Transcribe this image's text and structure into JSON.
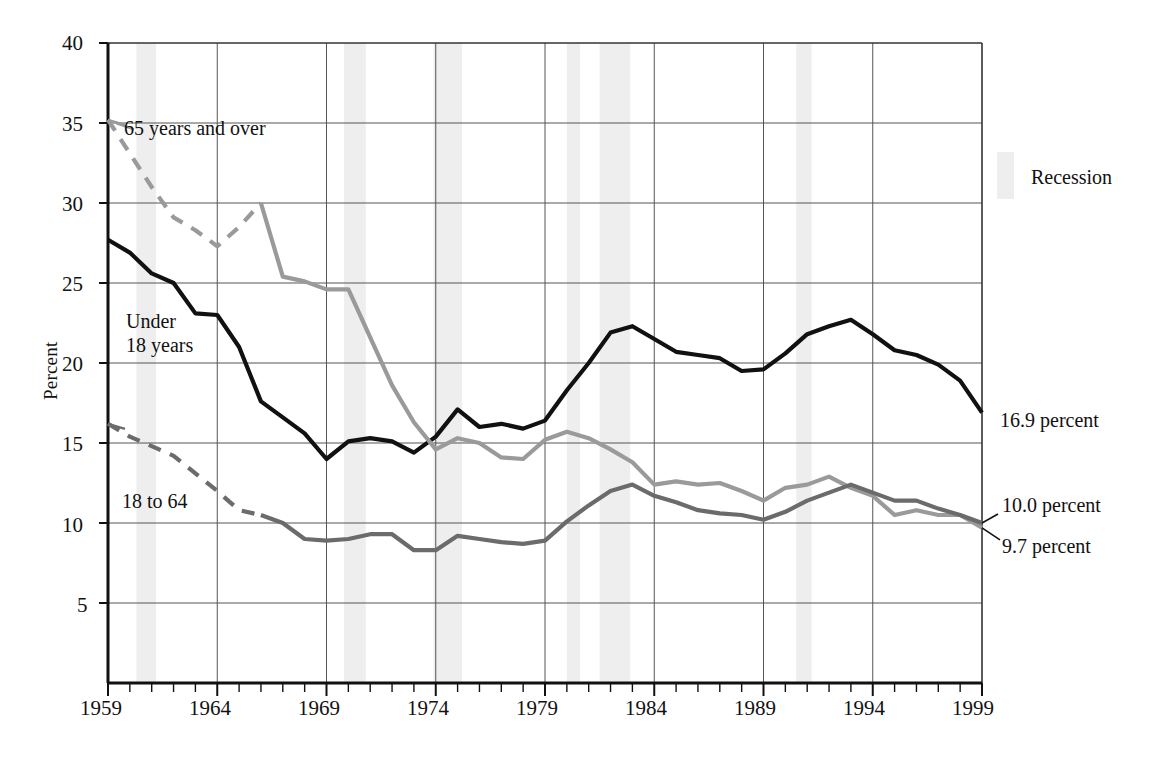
{
  "chart_data": {
    "type": "line",
    "title": "",
    "xlabel": "",
    "ylabel": "Percent",
    "xlim": [
      1959,
      1999
    ],
    "ylim": [
      0,
      40
    ],
    "ytick_values": [
      5,
      10,
      15,
      20,
      25,
      30,
      35,
      40
    ],
    "ytick_labels": [
      "5",
      "10",
      "15",
      "20",
      "25",
      "30",
      "35",
      "40"
    ],
    "xtick_labels": [
      "1959",
      "1964",
      "1969",
      "1974",
      "1979",
      "1984",
      "1989",
      "1994",
      "1999"
    ],
    "xtick_values": [
      1959,
      1964,
      1969,
      1974,
      1979,
      1984,
      1989,
      1994,
      1999
    ],
    "grid": "both",
    "minor_xticks_every": 1,
    "x": [
      1959,
      1960,
      1961,
      1962,
      1963,
      1964,
      1965,
      1966,
      1967,
      1968,
      1969,
      1970,
      1971,
      1972,
      1973,
      1974,
      1975,
      1976,
      1977,
      1978,
      1979,
      1980,
      1981,
      1982,
      1983,
      1984,
      1985,
      1986,
      1987,
      1988,
      1989,
      1990,
      1991,
      1992,
      1993,
      1994,
      1995,
      1996,
      1997,
      1998,
      1999
    ],
    "series": [
      {
        "name": "Under 18 years",
        "color": "#111111",
        "style": "solid",
        "width": 4.2,
        "end_label": "16.9 percent",
        "values": [
          27.7,
          26.9,
          25.6,
          25.0,
          23.1,
          23.0,
          21.0,
          17.6,
          16.6,
          15.6,
          14.0,
          15.1,
          15.3,
          15.1,
          14.4,
          15.4,
          17.1,
          16.0,
          16.2,
          15.9,
          16.4,
          18.3,
          20.0,
          21.9,
          22.3,
          21.5,
          20.7,
          20.5,
          20.3,
          19.5,
          19.6,
          20.6,
          21.8,
          22.3,
          22.7,
          21.8,
          20.8,
          20.5,
          19.9,
          18.9,
          16.9
        ]
      },
      {
        "name": "65 years and over",
        "color": "#9a9a9a",
        "style": "dashed-then-solid",
        "solid_from": 1966,
        "width": 4.2,
        "end_label": "9.7 percent",
        "values": [
          35.2,
          33.1,
          31.0,
          29.1,
          28.3,
          27.3,
          28.5,
          30.0,
          25.4,
          25.1,
          24.6,
          24.6,
          21.6,
          18.6,
          16.3,
          14.6,
          15.3,
          15.0,
          14.1,
          14.0,
          15.2,
          15.7,
          15.3,
          14.6,
          13.8,
          12.4,
          12.6,
          12.4,
          12.5,
          12.0,
          11.4,
          12.2,
          12.4,
          12.9,
          12.2,
          11.7,
          10.5,
          10.8,
          10.5,
          10.5,
          9.7
        ]
      },
      {
        "name": "18 to 64",
        "color": "#6b6b6b",
        "style": "dashed-then-solid",
        "solid_from": 1966,
        "width": 4.2,
        "end_label": "10.0 percent",
        "values": [
          16.2,
          15.4,
          14.8,
          14.2,
          13.1,
          12.0,
          10.8,
          10.5,
          10.0,
          9.0,
          8.9,
          9.0,
          9.3,
          9.3,
          8.3,
          8.3,
          9.2,
          9.0,
          8.8,
          8.7,
          8.9,
          10.1,
          11.1,
          12.0,
          12.4,
          11.7,
          11.3,
          10.8,
          10.6,
          10.5,
          10.2,
          10.7,
          11.4,
          11.9,
          12.4,
          11.9,
          11.4,
          11.4,
          10.9,
          10.5,
          10.0
        ]
      }
    ],
    "recessions": [
      {
        "start": 1960.3,
        "end": 1961.2
      },
      {
        "start": 1969.8,
        "end": 1970.8
      },
      {
        "start": 1973.9,
        "end": 1975.2
      },
      {
        "start": 1980.0,
        "end": 1980.6
      },
      {
        "start": 1981.5,
        "end": 1982.9
      },
      {
        "start": 1990.5,
        "end": 1991.2
      }
    ],
    "recession_color": "#eeeeee",
    "annotations": [
      {
        "name": "label-65-and-over",
        "text": "65 years and over",
        "x_px": 124,
        "y_px": 117
      },
      {
        "name": "label-under-18",
        "text": "Under\n18 years",
        "x_px": 126,
        "y_px": 310
      },
      {
        "name": "label-18-to-64",
        "text": "18 to 64",
        "x_px": 122,
        "y_px": 490
      }
    ],
    "legend": {
      "position": "right",
      "entries": [
        {
          "label": "Recession",
          "color": "#eeeeee"
        }
      ]
    }
  },
  "labels": {
    "ylabel": "Percent",
    "legend_recession": "Recession",
    "annot_65": "65 years and over",
    "annot_under18_line1": "Under",
    "annot_under18_line2": "18 years",
    "annot_18to64": "18 to 64",
    "end_169": "16.9 percent",
    "end_100": "10.0 percent",
    "end_97": "9.7 percent",
    "y_40": "40",
    "y_35": "35",
    "y_30": "30",
    "y_25": "25",
    "y_20": "20",
    "y_15": "15",
    "y_10": "10",
    "y_5": "5",
    "x_1959": "1959",
    "x_1964": "1964",
    "x_1969": "1969",
    "x_1974": "1974",
    "x_1979": "1979",
    "x_1984": "1984",
    "x_1989": "1989",
    "x_1994": "1994",
    "x_1999": "1999"
  }
}
